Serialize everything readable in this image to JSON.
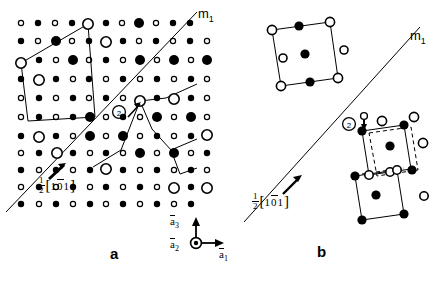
{
  "figure": {
    "background_color": "#ffffff",
    "line_color": "#000000",
    "width": 441,
    "height": 281
  },
  "panels": [
    {
      "id": "a",
      "label": "a",
      "description": "Atomic lattice with mirror plane m1 and unit cell outlines",
      "mirror_label": "m",
      "mirror_sub": "1",
      "burgers": {
        "numerator": "1",
        "denominator": "2",
        "bracket_open": "[",
        "bracket_close": "]",
        "index_1": "1",
        "index_2": "0",
        "index_3": "1",
        "index_2_overbar": true,
        "full_text": "1/2[101]"
      },
      "marker_label": "2"
    },
    {
      "id": "b",
      "label": "b",
      "description": "Unit cells separated by mirror plane m1, with dashed reference cells",
      "mirror_label": "m",
      "mirror_sub": "1",
      "burgers": {
        "numerator": "1",
        "denominator": "2",
        "bracket_open": "[",
        "bracket_close": "]",
        "index_1": "1",
        "index_2": "0",
        "index_3": "1",
        "index_2_overbar": true,
        "full_text": "1/2[101]"
      },
      "marker_label": "2"
    }
  ],
  "axis_triad": {
    "a3": {
      "symbol": "a",
      "sub": "3",
      "overbar": true,
      "direction": "up"
    },
    "a2": {
      "symbol": "a",
      "sub": "2",
      "overbar": true,
      "direction": "out-of-page"
    },
    "a1": {
      "symbol": "a",
      "sub": "1",
      "overbar": true,
      "direction": "right"
    }
  },
  "legend": {
    "marker_types": [
      {
        "name": "small-open-circle",
        "fill": "none",
        "radius": 2.6
      },
      {
        "name": "small-filled-circle",
        "fill": "#000000",
        "radius": 3.2
      },
      {
        "name": "large-open-circle",
        "fill": "none",
        "radius": 5.2
      },
      {
        "name": "large-filled-circle",
        "fill": "#000000",
        "radius": 5.0
      }
    ]
  }
}
